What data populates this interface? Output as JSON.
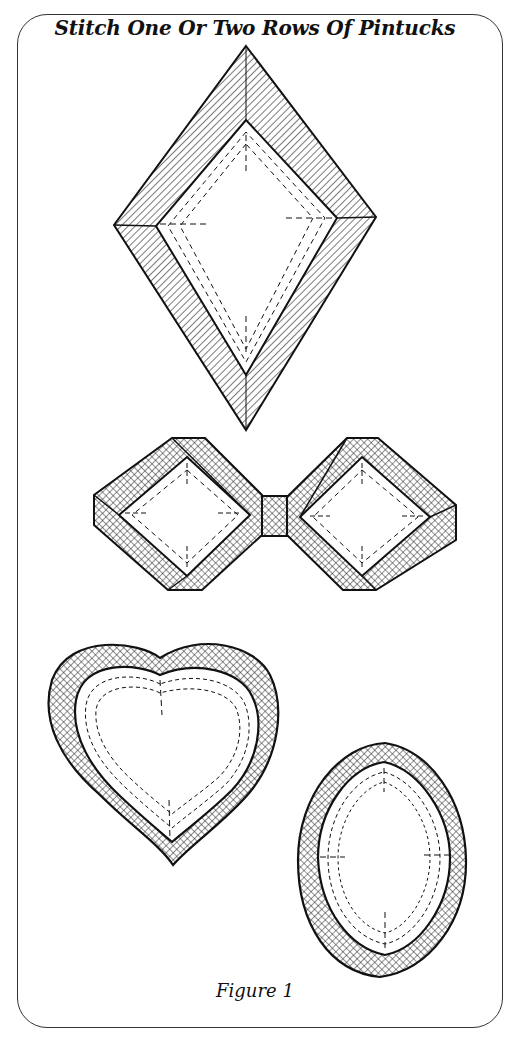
{
  "figure": {
    "title": "Stitch One Or Two Rows Of Pintucks",
    "caption": "Figure 1",
    "shapes": [
      {
        "name": "diamond",
        "label": "Diamond with pintuck border"
      },
      {
        "name": "bow-tie",
        "label": "Bow tie of two squares joined by knot"
      },
      {
        "name": "heart",
        "label": "Heart with pintuck border"
      },
      {
        "name": "oval",
        "label": "Oval with pintuck border"
      }
    ],
    "colors": {
      "ink": "#111111",
      "paper": "#ffffff"
    }
  }
}
